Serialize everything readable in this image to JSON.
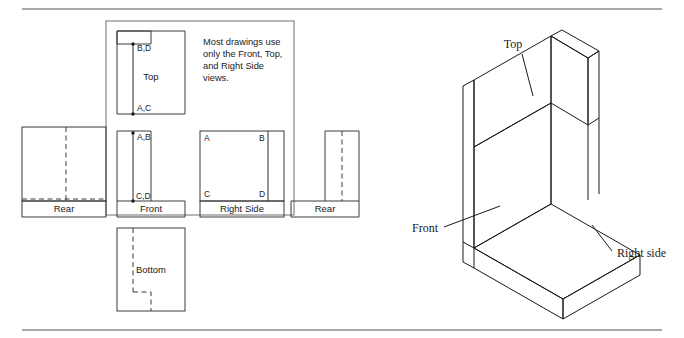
{
  "figure": {
    "note": {
      "lines": [
        "Most drawings use",
        "only the Front, Top,",
        "and Right Side",
        "views."
      ]
    },
    "colors": {
      "rule": "#8c8c8c",
      "outline": "#3a3a3a",
      "group_box": "#6f6f6f",
      "solid_edge": "#2b2b2b",
      "hidden_edge": "#3a3a3a",
      "iso_edge": "#1a1a1a",
      "text": "#1a1a1a",
      "background": "#ffffff"
    },
    "orthographic_views": [
      {
        "id": "rear-left",
        "label": "Rear",
        "highlighted": false,
        "has_hidden_lines": true,
        "shape": "square-with-hidden-notch"
      },
      {
        "id": "top",
        "label": "Top",
        "highlighted": true,
        "has_hidden_lines": false,
        "shape": "rectangle-with-notch",
        "corner_labels": [
          "B,D",
          "A,C"
        ]
      },
      {
        "id": "front",
        "label": "Front",
        "highlighted": true,
        "has_hidden_lines": false,
        "shape": "L-shape",
        "corner_labels": [
          "A,B",
          "C,D"
        ]
      },
      {
        "id": "right-side",
        "label": "Right Side",
        "highlighted": true,
        "has_hidden_lines": false,
        "shape": "rectangle-with-division",
        "corner_labels": [
          "A",
          "B",
          "C",
          "D"
        ]
      },
      {
        "id": "rear-right",
        "label": "Rear",
        "highlighted": false,
        "has_hidden_lines": true,
        "shape": "narrow-vertical-rectangle"
      },
      {
        "id": "bottom",
        "label": "Bottom",
        "highlighted": false,
        "has_hidden_lines": true,
        "shape": "rectangle-with-hidden-notch"
      }
    ],
    "isometric": {
      "labels": [
        {
          "id": "iso-top",
          "text": "Top"
        },
        {
          "id": "iso-front",
          "text": "Front"
        },
        {
          "id": "iso-right",
          "text": "Right side"
        }
      ]
    },
    "corner_markers": {
      "top_upper": "B,D",
      "top_lower": "A,C",
      "front_upper": "A,B",
      "front_lower": "C,D",
      "side_a": "A",
      "side_b": "B",
      "side_c": "C",
      "side_d": "D"
    }
  }
}
